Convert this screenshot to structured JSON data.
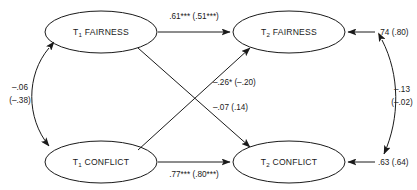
{
  "figure": {
    "type": "path-diagram",
    "width": 417,
    "height": 190,
    "background_color": "#ffffff",
    "stroke_color": "#1a1a1a"
  },
  "nodes": {
    "t1_fairness": {
      "label_prefix": "T",
      "label_sub": "1",
      "label_main": " FAIRNESS"
    },
    "t2_fairness": {
      "label_prefix": "T",
      "label_sub": "2",
      "label_main": " FAIRNESS"
    },
    "t1_conflict": {
      "label_prefix": "T",
      "label_sub": "1",
      "label_main": " CONFLICT"
    },
    "t2_conflict": {
      "label_prefix": "T",
      "label_sub": "2",
      "label_main": " CONFLICT"
    }
  },
  "edges": {
    "fairness_autoregressive": {
      "label": ".61*** (.51***)",
      "from": "t1_fairness",
      "to": "t2_fairness"
    },
    "conflict_autoregressive": {
      "label": ".77*** (.80***)",
      "from": "t1_conflict",
      "to": "t2_conflict"
    },
    "conflict_to_fairness": {
      "label": "–.26* (–.20)",
      "from": "t1_conflict",
      "to": "t2_fairness"
    },
    "fairness_to_conflict": {
      "label": "–.07 (.14)",
      "from": "t1_fairness",
      "to": "t2_conflict"
    },
    "t1_correlation": {
      "label_line1": "–.06",
      "label_line2": "(–.38)",
      "between": [
        "t1_fairness",
        "t1_conflict"
      ]
    },
    "t2_residual_correlation": {
      "label_line1": "–.13",
      "label_line2": "(–.02)",
      "between": [
        "t2_fairness_residual",
        "t2_conflict_residual"
      ]
    },
    "t2_fairness_residual": {
      "label": ".74 (.80)",
      "to": "t2_fairness"
    },
    "t2_conflict_residual": {
      "label": ".63 (.64)",
      "to": "t2_conflict"
    }
  }
}
